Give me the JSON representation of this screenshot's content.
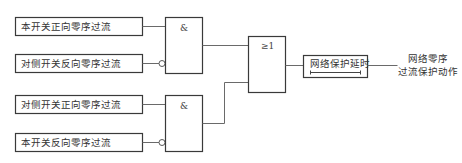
{
  "diagram": {
    "type": "logic-diagram",
    "inputs": [
      {
        "label": "本开关正向零序过流",
        "negated_at_gate": false,
        "gate": "and_1"
      },
      {
        "label": "对侧开关反向零序过流",
        "negated_at_gate": true,
        "gate": "and_1"
      },
      {
        "label": "对侧开关正向零序过流",
        "negated_at_gate": false,
        "gate": "and_2"
      },
      {
        "label": "本开关反向零序过流",
        "negated_at_gate": true,
        "gate": "and_2"
      }
    ],
    "gates": {
      "and_1": {
        "symbol": "&"
      },
      "and_2": {
        "symbol": "&"
      },
      "or_1": {
        "symbol": "≥1"
      }
    },
    "delay": {
      "label": "网络保护延时"
    },
    "output": {
      "line1": "网络零序",
      "line2": "过流保护动作"
    },
    "colors": {
      "box_stroke": "#3a3a3a",
      "wire": "#6a6a6a",
      "text": "#333333",
      "background": "#ffffff"
    }
  }
}
